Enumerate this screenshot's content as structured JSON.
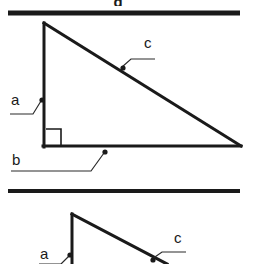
{
  "figure": {
    "title_fragment": "g",
    "background_color": "#ffffff",
    "ink_color": "#1a1a1a",
    "rule_color": "#1a1a1a",
    "rules": [
      {
        "name": "top-rule",
        "x1": 8,
        "y1": 13,
        "x2": 240,
        "y2": 13,
        "thickness": 5
      },
      {
        "name": "middle-rule",
        "x1": 8,
        "y1": 191,
        "x2": 240,
        "y2": 191,
        "thickness": 4
      }
    ],
    "diagram_top": {
      "name": "right-triangle-full",
      "vertices": {
        "apex": [
          44,
          23
        ],
        "right_angle": [
          44,
          146
        ],
        "right_vertex": [
          240,
          146
        ]
      },
      "right_angle_marker": {
        "x": 46,
        "y": 130,
        "size": 15
      },
      "stroke_width": 3,
      "labels": [
        {
          "id": "label-a-top",
          "text": "a",
          "x": 11,
          "y": 105,
          "leader": {
            "h_x1": 10,
            "h_x2": 33,
            "h_y": 114,
            "dot_x": 42,
            "dot_y": 100
          }
        },
        {
          "id": "label-b-top",
          "text": "b",
          "x": 12,
          "y": 165,
          "leader": {
            "h_x1": 11,
            "h_x2": 91,
            "h_y": 171,
            "dot_x": 105,
            "dot_y": 152
          }
        },
        {
          "id": "label-c-top",
          "text": "c",
          "x": 144,
          "y": 48,
          "leader": {
            "h_x1": 155,
            "h_x2": 131,
            "h_y": 59,
            "dot_x": 123,
            "dot_y": 68
          }
        }
      ]
    },
    "diagram_bottom": {
      "name": "right-triangle-partial",
      "vertices": {
        "apex": [
          72,
          214
        ],
        "bottom_left": [
          72,
          264
        ],
        "hypotenuse_end": [
          163,
          264
        ]
      },
      "stroke_width": 3,
      "labels": [
        {
          "id": "label-a-bottom",
          "text": "a",
          "x": 40,
          "y": 259,
          "leader": {
            "h_x1": 39,
            "h_x2": 61,
            "h_y": 264,
            "dot_x": 70,
            "dot_y": 255
          }
        },
        {
          "id": "label-c-bottom",
          "text": "c",
          "x": 174,
          "y": 243,
          "leader": {
            "h_x1": 186,
            "h_x2": 162,
            "h_y": 252,
            "dot_x": 153,
            "dot_y": 260
          }
        }
      ]
    }
  }
}
